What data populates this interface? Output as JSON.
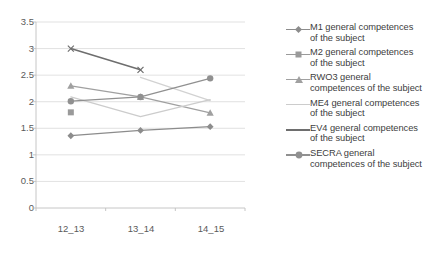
{
  "chart_data": {
    "type": "line",
    "title": "",
    "xlabel": "",
    "ylabel": "",
    "categories": [
      "12_13",
      "13_14",
      "14_15"
    ],
    "ylim": [
      0,
      3.5
    ],
    "ytick_labels": [
      "0",
      "0.5",
      "1",
      "1.5",
      "2",
      "2.5",
      "3",
      "3.5"
    ],
    "ytick_values": [
      0,
      0.5,
      1,
      1.5,
      2,
      2.5,
      3,
      3.5
    ],
    "grid": true,
    "legend_position": "right",
    "series": [
      {
        "name": "M1 general competences of the subject",
        "marker": "diamond",
        "color": "#8c8c8c",
        "values": [
          1.36,
          1.46,
          1.53
        ]
      },
      {
        "name": "M2 general competences of the subject",
        "marker": "square",
        "color": "#9a9a9a",
        "values": [
          1.8,
          null,
          null
        ]
      },
      {
        "name": "RWO3 general competences of the subject",
        "marker": "triangle",
        "color": "#a0a0a0",
        "values": [
          2.3,
          2.09,
          1.79
        ]
      },
      {
        "name": "ME4 general competences of the subject",
        "marker": "none",
        "color": "#cccccc",
        "values": [
          2.09,
          1.72,
          2.04
        ]
      },
      {
        "name": "EV4 general competences of the subject",
        "marker": "x",
        "color": "#6e6e6e",
        "values": [
          3.0,
          2.6,
          null
        ]
      },
      {
        "name": "SECRA general competences of the subject",
        "marker": "circle",
        "color": "#909090",
        "values": [
          2.01,
          2.09,
          2.44
        ]
      }
    ],
    "extra_segments": [
      {
        "name": "ME4 descending segment",
        "color": "#d2d2d2",
        "from": {
          "x": "13_14",
          "y": 2.46
        },
        "to": {
          "x": "14_15",
          "y": 2.02
        }
      }
    ]
  },
  "legend": {
    "entries": [
      {
        "line1": "M1 general competences",
        "line2": "of the subject",
        "icon": "diamond-marker-icon"
      },
      {
        "line1": "M2 general competences",
        "line2": "of the subject",
        "icon": "square-marker-icon"
      },
      {
        "line1": "RWO3 general",
        "line2": "competences of the subject",
        "icon": "triangle-marker-icon"
      },
      {
        "line1": "ME4 general competences",
        "line2": "of the subject",
        "icon": "line-marker-icon"
      },
      {
        "line1": "EV4 general competences",
        "line2": "of the subject",
        "icon": "line-marker-icon"
      },
      {
        "line1": "SECRA general",
        "line2": "competences of the subject",
        "icon": "circle-marker-icon"
      }
    ]
  },
  "axis": {
    "y_labels": [
      "3.5",
      "3",
      "2.5",
      "2",
      "1.5",
      "1",
      "0.5",
      "0"
    ],
    "x_labels": [
      "12_13",
      "13_14",
      "14_15"
    ]
  },
  "colors": {
    "grid": "#d9d9d9",
    "axis": "#bfbfbf",
    "tick_text": "#5a5a5a",
    "legend_text": "#404040"
  }
}
